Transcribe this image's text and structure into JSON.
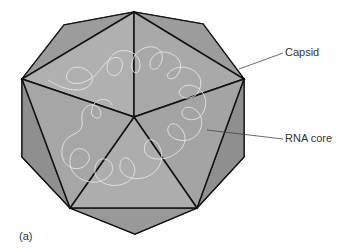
{
  "figure": {
    "panel_label": "(a)",
    "labels": {
      "capsid": "Capsid",
      "rna_core": "RNA core"
    },
    "colors": {
      "face": "#a8a8a8",
      "edge": "#111111",
      "rna": "#e6e6e6",
      "leader": "#444444"
    }
  }
}
